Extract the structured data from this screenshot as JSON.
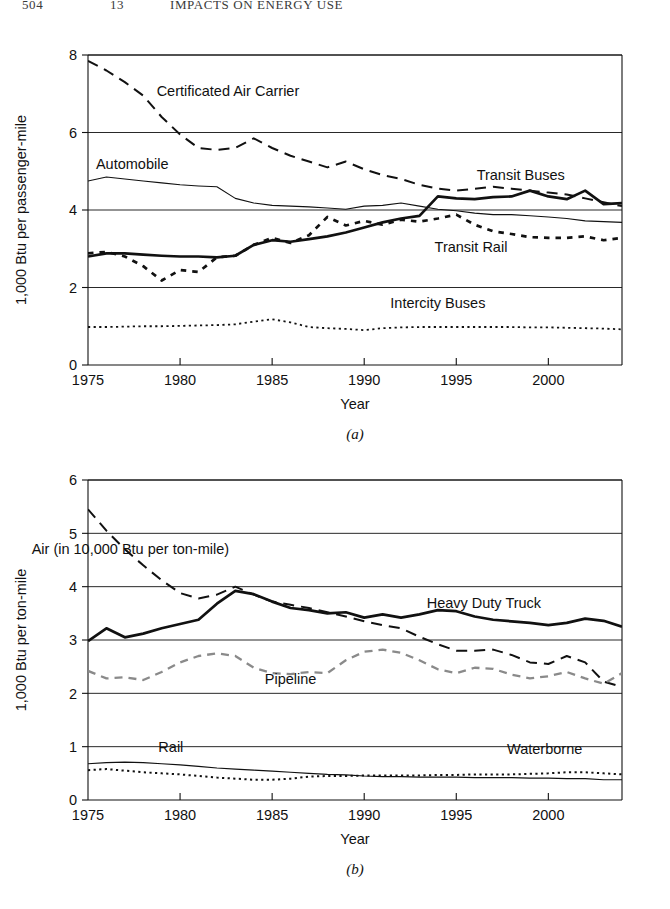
{
  "running_head": {
    "folio": "504",
    "chapter": "13",
    "title": "IMPACTS ON ENERGY USE"
  },
  "figures": [
    {
      "id": "a",
      "caption": "(a)",
      "xlabel": "Year",
      "ylabel": "1,000 Btu per passenger-mile"
    },
    {
      "id": "b",
      "caption": "(b)",
      "xlabel": "Year",
      "ylabel": "1,000 Btu per ton-mile"
    }
  ],
  "chart_data": [
    {
      "type": "line",
      "title": "",
      "subtitle": "",
      "panel": "(a)",
      "xlabel": "Year",
      "ylabel": "1,000 Btu per passenger-mile",
      "xlim": [
        1975,
        2004
      ],
      "ylim": [
        0,
        8
      ],
      "xticks": [
        1975,
        1980,
        1985,
        1990,
        1995,
        2000
      ],
      "xticklabels": [
        "1975",
        "1980",
        "1985",
        "1990",
        "1995",
        "2000"
      ],
      "yticks": [
        0,
        2,
        4,
        6,
        8
      ],
      "yticklabels": [
        "0",
        "2",
        "4",
        "6",
        "8"
      ],
      "grid": "horizontal",
      "legend": "inline-annotations",
      "x": [
        1975,
        1976,
        1977,
        1978,
        1979,
        1980,
        1981,
        1982,
        1983,
        1984,
        1985,
        1986,
        1987,
        1988,
        1989,
        1990,
        1991,
        1992,
        1993,
        1994,
        1995,
        1996,
        1997,
        1998,
        1999,
        2000,
        2001,
        2002,
        2003,
        2004
      ],
      "series": [
        {
          "name": "Certificated Air Carrier",
          "style": "dashed",
          "color": "#111111",
          "width": 2.0,
          "label_x": 1982.6,
          "label_y": 6.95,
          "values": [
            7.85,
            7.6,
            7.3,
            6.95,
            6.4,
            5.95,
            5.6,
            5.55,
            5.6,
            5.85,
            5.6,
            5.4,
            5.25,
            5.1,
            5.25,
            5.05,
            4.9,
            4.8,
            4.65,
            4.55,
            4.5,
            4.55,
            4.6,
            4.55,
            4.5,
            4.45,
            4.4,
            4.3,
            4.2,
            4.1
          ]
        },
        {
          "name": "Automobile",
          "style": "solid-thin",
          "color": "#111111",
          "width": 1.1,
          "label_x": 1977.4,
          "label_y": 5.05,
          "values": [
            4.75,
            4.85,
            4.8,
            4.75,
            4.7,
            4.65,
            4.62,
            4.6,
            4.3,
            4.18,
            4.12,
            4.1,
            4.08,
            4.05,
            4.02,
            4.1,
            4.12,
            4.18,
            4.1,
            4.02,
            3.98,
            3.92,
            3.88,
            3.88,
            3.85,
            3.82,
            3.78,
            3.72,
            3.7,
            3.68
          ]
        },
        {
          "name": "Transit Buses",
          "style": "solid-thick",
          "color": "#111111",
          "width": 2.7,
          "label_x": 1998.5,
          "label_y": 4.78,
          "values": [
            2.8,
            2.88,
            2.88,
            2.85,
            2.82,
            2.8,
            2.8,
            2.78,
            2.82,
            3.1,
            3.22,
            3.18,
            3.25,
            3.32,
            3.42,
            3.55,
            3.68,
            3.78,
            3.85,
            4.35,
            4.3,
            4.28,
            4.33,
            4.35,
            4.5,
            4.35,
            4.28,
            4.5,
            4.15,
            4.18
          ]
        },
        {
          "name": "Transit Rail",
          "style": "dotted-thick",
          "color": "#111111",
          "width": 2.7,
          "label_x": 1995.8,
          "label_y": 2.92,
          "values": [
            2.88,
            2.92,
            2.8,
            2.55,
            2.18,
            2.45,
            2.4,
            2.78,
            2.82,
            3.1,
            3.28,
            3.15,
            3.35,
            3.82,
            3.6,
            3.72,
            3.62,
            3.75,
            3.7,
            3.78,
            3.88,
            3.62,
            3.45,
            3.38,
            3.3,
            3.28,
            3.28,
            3.32,
            3.22,
            3.28
          ]
        },
        {
          "name": "Intercity Buses",
          "style": "dotted-thin",
          "color": "#111111",
          "width": 1.8,
          "label_x": 1994.0,
          "label_y": 1.48,
          "values": [
            0.98,
            0.98,
            0.99,
            1.0,
            1.0,
            1.01,
            1.02,
            1.03,
            1.05,
            1.12,
            1.18,
            1.1,
            0.98,
            0.95,
            0.93,
            0.9,
            0.95,
            0.97,
            0.98,
            0.98,
            0.98,
            0.98,
            0.98,
            0.98,
            0.97,
            0.97,
            0.96,
            0.95,
            0.94,
            0.92
          ]
        }
      ]
    },
    {
      "type": "line",
      "title": "",
      "subtitle": "",
      "panel": "(b)",
      "xlabel": "Year",
      "ylabel": "1,000 Btu per ton-mile",
      "xlim": [
        1975,
        2004
      ],
      "ylim": [
        0,
        6
      ],
      "xticks": [
        1975,
        1980,
        1985,
        1990,
        1995,
        2000
      ],
      "xticklabels": [
        "1975",
        "1980",
        "1985",
        "1990",
        "1995",
        "2000"
      ],
      "yticks": [
        0,
        1,
        2,
        3,
        4,
        5,
        6
      ],
      "yticklabels": [
        "0",
        "1",
        "2",
        "3",
        "4",
        "5",
        "6"
      ],
      "grid": "horizontal",
      "legend": "inline-annotations",
      "x": [
        1975,
        1976,
        1977,
        1978,
        1979,
        1980,
        1981,
        1982,
        1983,
        1984,
        1985,
        1986,
        1987,
        1988,
        1989,
        1990,
        1991,
        1992,
        1993,
        1994,
        1995,
        1996,
        1997,
        1998,
        1999,
        2000,
        2001,
        2002,
        2003,
        2004
      ],
      "series": [
        {
          "name": "Air (in 10,000 Btu per ton-mile)",
          "style": "dashed",
          "color": "#111111",
          "width": 2.0,
          "label_x": 1977.3,
          "label_y": 4.62,
          "values": [
            5.45,
            5.05,
            4.7,
            4.4,
            4.12,
            3.88,
            3.78,
            3.85,
            4.0,
            3.85,
            3.72,
            3.66,
            3.6,
            3.52,
            3.44,
            3.35,
            3.28,
            3.22,
            3.06,
            2.92,
            2.8,
            2.8,
            2.82,
            2.72,
            2.58,
            2.55,
            2.7,
            2.58,
            2.22,
            2.12
          ]
        },
        {
          "name": "Heavy Duty Truck",
          "style": "solid-thick",
          "color": "#111111",
          "width": 2.7,
          "label_x": 1996.5,
          "label_y": 3.6,
          "values": [
            2.98,
            3.22,
            3.05,
            3.12,
            3.22,
            3.3,
            3.38,
            3.68,
            3.92,
            3.86,
            3.72,
            3.6,
            3.56,
            3.5,
            3.52,
            3.42,
            3.48,
            3.42,
            3.48,
            3.56,
            3.54,
            3.44,
            3.38,
            3.35,
            3.32,
            3.28,
            3.32,
            3.4,
            3.36,
            3.25
          ]
        },
        {
          "name": "Pipeline",
          "style": "dashed-gray",
          "color": "#8a8a8a",
          "width": 2.3,
          "label_x": 1986.0,
          "label_y": 2.18,
          "values": [
            2.42,
            2.28,
            2.3,
            2.25,
            2.4,
            2.58,
            2.7,
            2.75,
            2.7,
            2.48,
            2.38,
            2.36,
            2.4,
            2.38,
            2.62,
            2.78,
            2.82,
            2.76,
            2.62,
            2.45,
            2.38,
            2.48,
            2.46,
            2.35,
            2.28,
            2.32,
            2.4,
            2.28,
            2.18,
            2.38
          ]
        },
        {
          "name": "Rail",
          "style": "solid-thin",
          "color": "#111111",
          "width": 1.2,
          "label_x": 1979.5,
          "label_y": 0.9,
          "values": [
            0.68,
            0.7,
            0.71,
            0.7,
            0.68,
            0.66,
            0.63,
            0.6,
            0.58,
            0.56,
            0.54,
            0.52,
            0.5,
            0.48,
            0.47,
            0.45,
            0.44,
            0.44,
            0.43,
            0.43,
            0.43,
            0.42,
            0.42,
            0.42,
            0.41,
            0.41,
            0.4,
            0.4,
            0.38,
            0.38
          ]
        },
        {
          "name": "Waterborne",
          "style": "dotted-thin",
          "color": "#111111",
          "width": 2.0,
          "label_x": 1999.8,
          "label_y": 0.86,
          "values": [
            0.56,
            0.58,
            0.55,
            0.52,
            0.5,
            0.48,
            0.45,
            0.42,
            0.4,
            0.38,
            0.38,
            0.4,
            0.44,
            0.45,
            0.45,
            0.46,
            0.46,
            0.46,
            0.46,
            0.47,
            0.47,
            0.48,
            0.48,
            0.48,
            0.49,
            0.5,
            0.52,
            0.52,
            0.5,
            0.48
          ]
        }
      ]
    }
  ]
}
